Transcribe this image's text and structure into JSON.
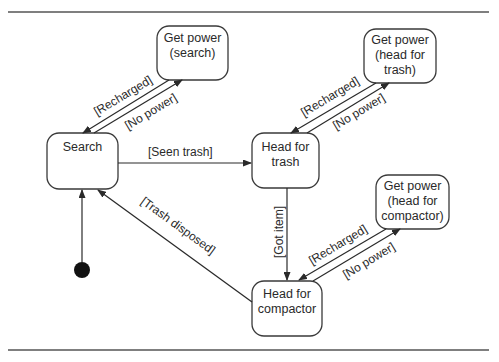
{
  "diagram": {
    "type": "state-machine",
    "states": [
      {
        "id": "search",
        "lines": [
          "Search"
        ]
      },
      {
        "id": "get_power_search",
        "lines": [
          "Get power",
          "(search)"
        ]
      },
      {
        "id": "head_for_trash",
        "lines": [
          "Head for",
          "trash"
        ]
      },
      {
        "id": "get_power_trash",
        "lines": [
          "Get power",
          "(head for",
          "trash)"
        ]
      },
      {
        "id": "get_power_compactor",
        "lines": [
          "Get power",
          "(head for",
          "compactor)"
        ]
      },
      {
        "id": "head_for_compactor",
        "lines": [
          "Head for",
          "compactor"
        ]
      }
    ],
    "initial_state": "search",
    "transitions": [
      {
        "from": "search",
        "to": "get_power_search",
        "label": "[No power]"
      },
      {
        "from": "get_power_search",
        "to": "search",
        "label": "[Recharged]"
      },
      {
        "from": "search",
        "to": "head_for_trash",
        "label": "[Seen trash]"
      },
      {
        "from": "head_for_trash",
        "to": "get_power_trash",
        "label": "[No power]"
      },
      {
        "from": "get_power_trash",
        "to": "head_for_trash",
        "label": "[Recharged]"
      },
      {
        "from": "head_for_trash",
        "to": "head_for_compactor",
        "label": "[Got item]"
      },
      {
        "from": "head_for_compactor",
        "to": "get_power_compactor",
        "label": "[No power]"
      },
      {
        "from": "get_power_compactor",
        "to": "head_for_compactor",
        "label": "[Recharged]"
      },
      {
        "from": "head_for_compactor",
        "to": "search",
        "label": "[Trash disposed]"
      }
    ]
  }
}
